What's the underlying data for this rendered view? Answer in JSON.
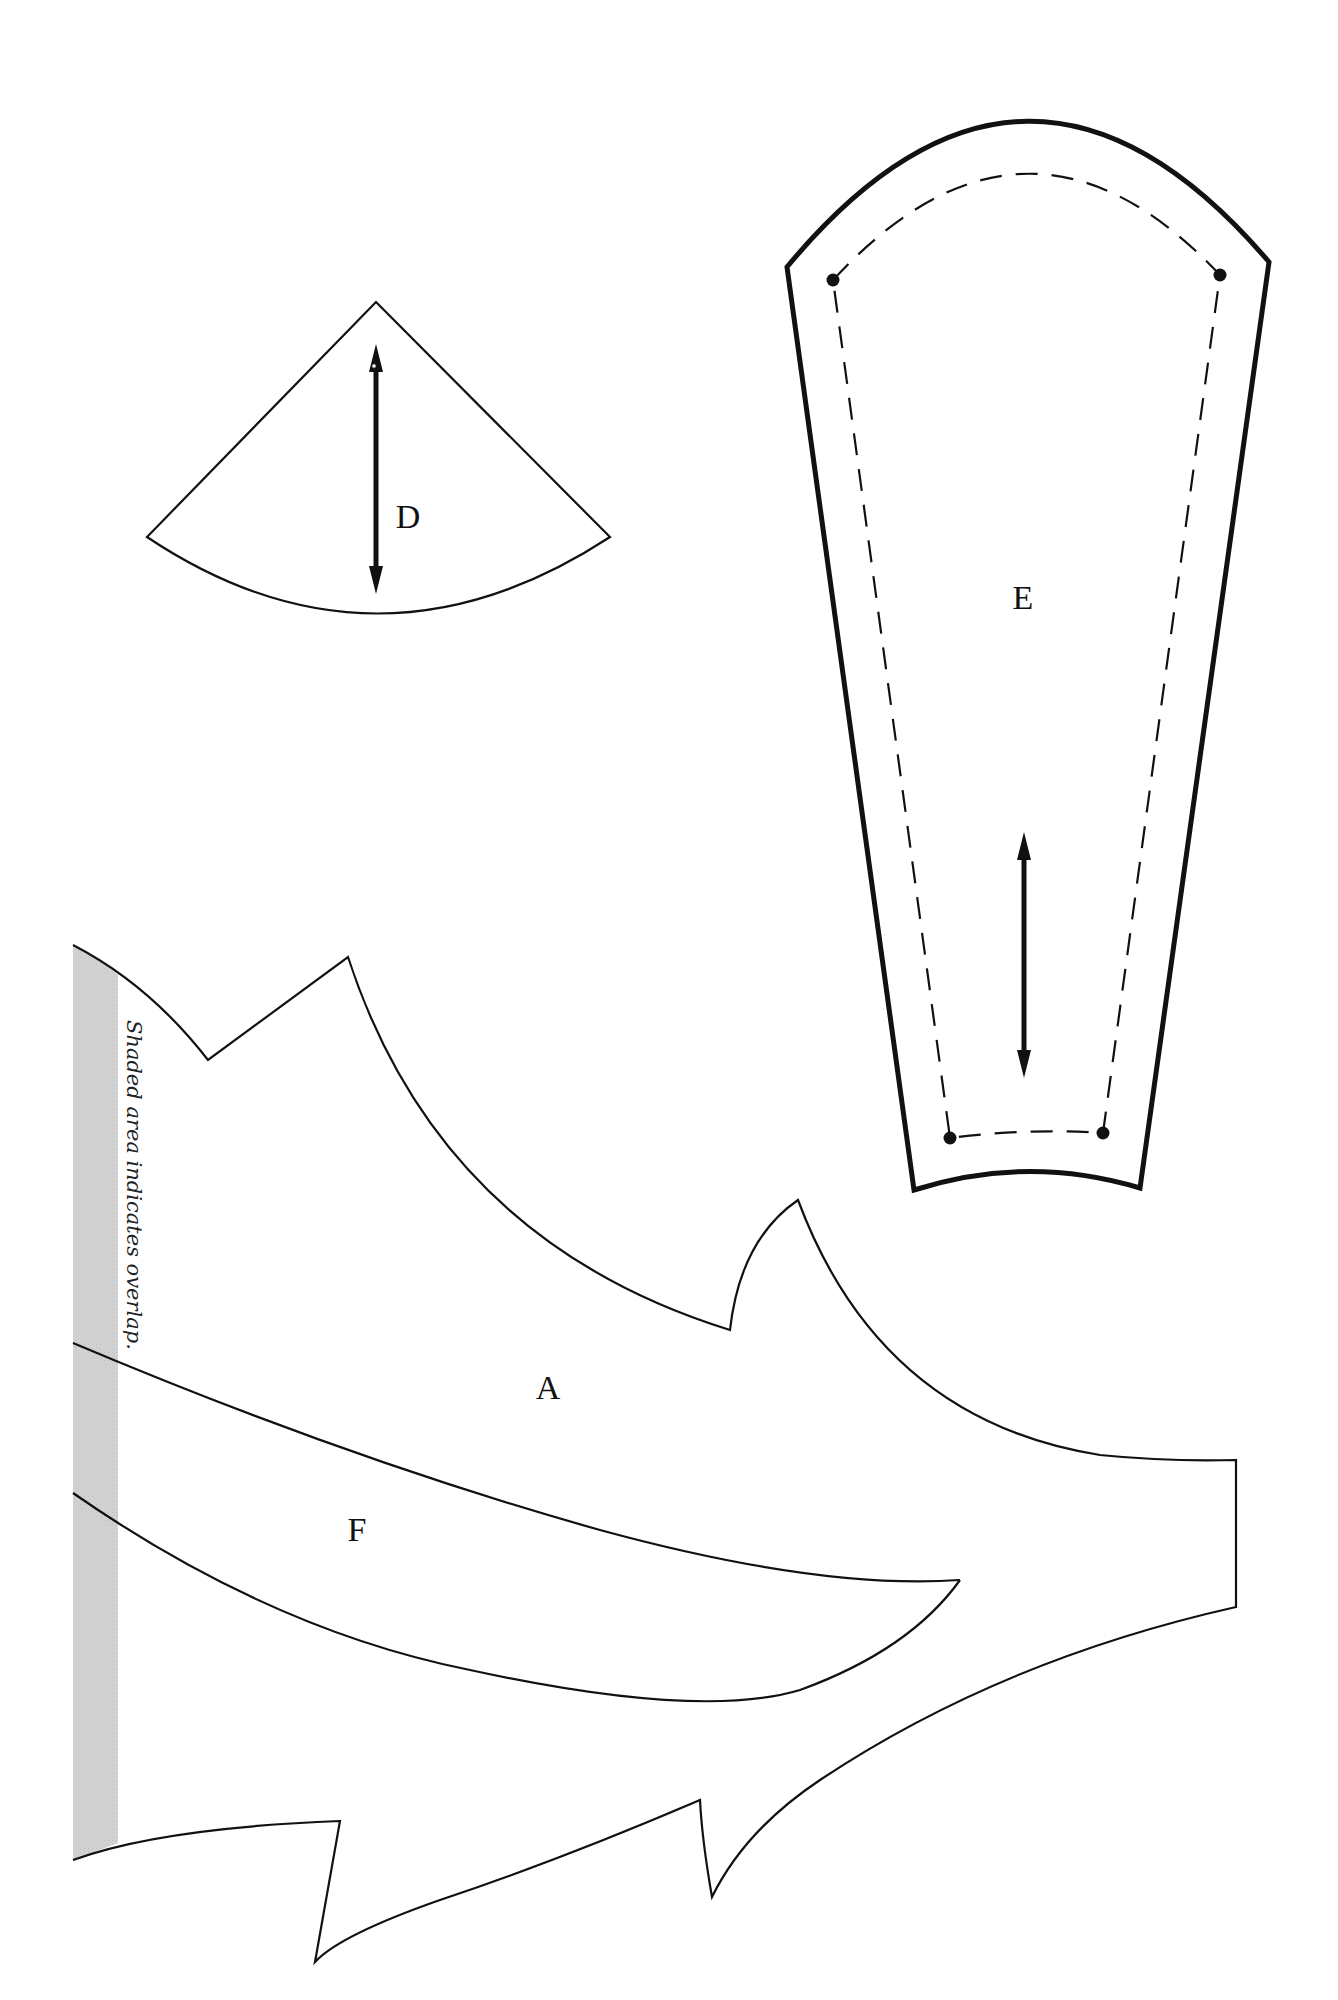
{
  "page": {
    "background": "#ffffff",
    "line_color": "#111111",
    "overlap_shade_color": "#cfcfcf"
  },
  "pieces": [
    {
      "id": "D",
      "label": "D",
      "has_grainline": true
    },
    {
      "id": "E",
      "label": "E",
      "has_grainline": true,
      "has_seam_allowance": true,
      "seam_dots": 4
    },
    {
      "id": "A",
      "label": "A"
    },
    {
      "id": "F",
      "label": "F"
    }
  ],
  "notes": {
    "overlap": "Shaded area indicates overlap."
  }
}
